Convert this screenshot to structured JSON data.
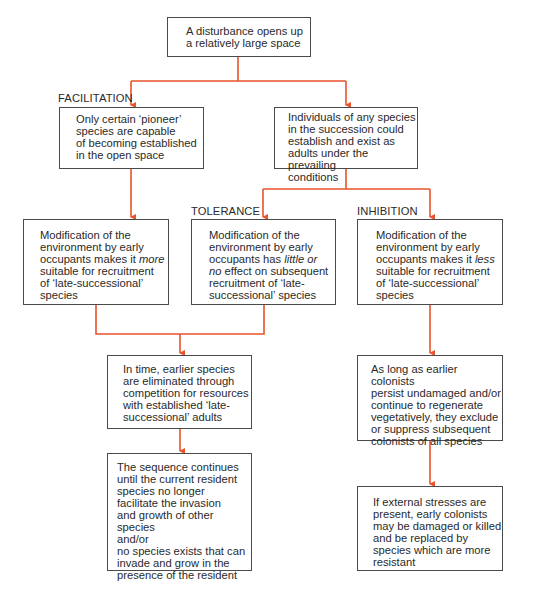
{
  "colors": {
    "arrow": "#e8532a",
    "border": "#4a4a4a",
    "text": "#2a2a2a"
  },
  "labels": {
    "facilitation": "FACILITATION",
    "tolerance": "TOLERANCE",
    "inhibition": "INHIBITION"
  },
  "boxes": {
    "start": {
      "text": "A disturbance opens up\na relatively large space"
    },
    "pioneer": {
      "text": "Only certain ‘pioneer’\nspecies are capable\nof becoming established\nin the open space"
    },
    "any_species": {
      "text": "Individuals of any species\nin the succession could\nestablish and exist as\nadults under the prevailing\nconditions"
    },
    "facilitation_mod": {
      "line1": "Modification of the\nenvironment by early\noccupants makes it ",
      "emph": "more",
      "line2": "\nsuitable for recruitment\nof ‘late-successional’\nspecies"
    },
    "tolerance_mod": {
      "line1": "Modification of the\nenvironment by early\noccupants has ",
      "emph": "little or\nno",
      "line2": " effect on subsequent\nrecruitment of ‘late-\nsuccessional’ species"
    },
    "inhibition_mod": {
      "line1": "Modification of the\nenvironment by early\noccupants makes it ",
      "emph": "less",
      "line2": "\nsuitable for recruitment\nof ‘late-successional’\nspecies"
    },
    "eliminated": {
      "text": "In time, earlier species\nare eliminated through\ncompetition for resources\nwith established ‘late-\nsuccessional’ adults"
    },
    "sequence": {
      "text": "The sequence continues\nuntil the current resident\nspecies no longer\nfacilitate the invasion\nand growth of other species\nand/or\nno species exists that can\ninvade and grow in the\npresence of the resident"
    },
    "persist": {
      "text": "As long as earlier colonists\npersist undamaged and/or\ncontinue to regenerate\nvegetatively, they exclude\nor suppress subsequent\ncolonists of all species"
    },
    "stresses": {
      "text": "If external stresses are\npresent, early colonists\nmay be damaged or killed\nand be replaced by\nspecies which are more\nresistant"
    }
  }
}
